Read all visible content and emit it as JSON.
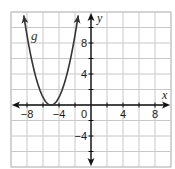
{
  "chart_data": {
    "type": "line",
    "title": "",
    "xlabel": "x",
    "ylabel": "y",
    "xlim": [
      -10,
      10
    ],
    "ylim": [
      -8,
      12
    ],
    "grid": true,
    "grid_step": 2,
    "x_ticks": [
      -8,
      -4,
      4,
      8
    ],
    "x_tick_labels": [
      "−8",
      "−4",
      "4",
      "8"
    ],
    "y_ticks": [
      8,
      4,
      -4
    ],
    "y_tick_labels": [
      "8",
      "4",
      "−4"
    ],
    "origin_label": "0",
    "series": [
      {
        "name": "g",
        "function": "g(x) = (x + 5)^2",
        "vertex": [
          -5,
          0
        ],
        "x": [
          -8.4,
          -8,
          -7,
          -6,
          -5,
          -4,
          -3,
          -2,
          -1.6
        ],
        "y": [
          11.56,
          9,
          4,
          1,
          0,
          1,
          4,
          9,
          11.56
        ],
        "color": "#333333",
        "arrows_at_ends": true
      }
    ]
  }
}
